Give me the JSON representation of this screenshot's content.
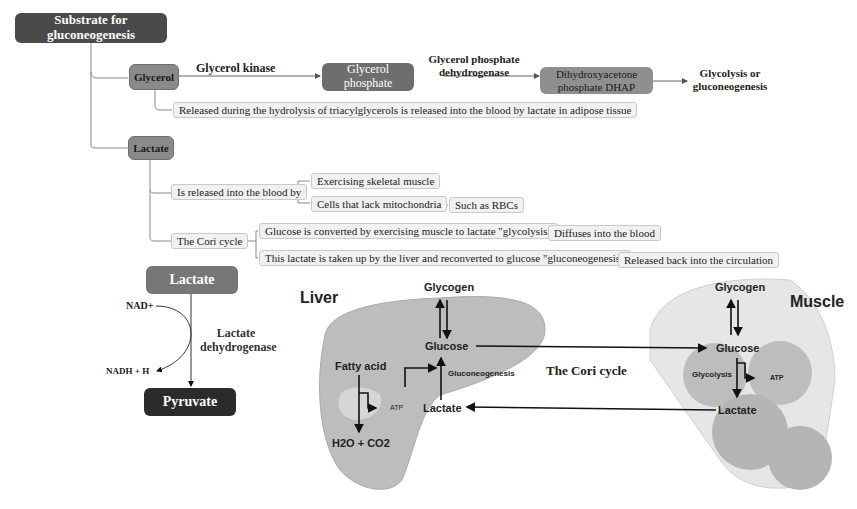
{
  "mindmap": {
    "root": "Substrate for gluconeogenesis",
    "glycerol": {
      "label": "Glycerol",
      "enzyme1": "Glycerol kinase",
      "product1": "Glycerol phosphate",
      "enzyme2_line1": "Glycerol phosphate",
      "enzyme2_line2": "dehydrogenase",
      "product2_line1": "Dihydroxyacetone",
      "product2_line2": "phosphate DHAP",
      "fate_line1": "Glycolysis or",
      "fate_line2": "gluconeogenesis",
      "note": "Released during the hydrolysis of triacylglycerols is released into the blood by lactate in adipose tissue"
    },
    "lactate": {
      "label": "Lactate",
      "released_by": "Is released into the blood by",
      "source1": "Exercising skeletal muscle",
      "source2": "Cells that lack mitochondria",
      "source2_example": "Such as RBCs",
      "cori": "The Cori cycle",
      "cori_step1": "Glucose is converted by exercising muscle to lactate \"glycolysis\"",
      "cori_step1_next": "Diffuses into the blood",
      "cori_step2": "This lactate is taken up by the liver and  reconverted to glucose \"gluconeogenesis\"",
      "cori_step2_next": "Released back into the circulation"
    }
  },
  "ldh_reaction": {
    "substrate": "Lactate",
    "product": "Pyruvate",
    "cofactor_in": "NAD+",
    "cofactor_out": "NADH + H",
    "enzyme_line1": "Lactate",
    "enzyme_line2": "dehydrogenase"
  },
  "cori_cycle": {
    "title": "The Cori cycle",
    "liver": {
      "title": "Liver",
      "glycogen": "Glycogen",
      "glucose": "Glucose",
      "lactate": "Lactate",
      "gluconeogenesis": "Gluconeogenesis",
      "fatty_acid": "Fatty acid",
      "atp": "ATP",
      "products": "H2O + CO2"
    },
    "muscle": {
      "title": "Muscle",
      "glycogen": "Glycogen",
      "glucose": "Glucose",
      "glycolysis": "Glycolysis",
      "atp": "ATP",
      "lactate": "Lactate"
    }
  },
  "colors": {
    "dark_node": "#4a4a4a",
    "mid_node": "#8a8a8a",
    "leaf_bg": "#f1f1f1",
    "pyruvate": "#2b2b2b",
    "lactate_node": "#777777",
    "organ_fill": "#bdbdbd"
  }
}
